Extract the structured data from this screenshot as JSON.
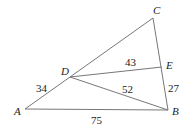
{
  "diagram": {
    "type": "geometry-triangle",
    "points": {
      "A": {
        "label": "A",
        "x": 25,
        "y": 109
      },
      "B": {
        "label": "B",
        "x": 168,
        "y": 110
      },
      "C": {
        "label": "C",
        "x": 153,
        "y": 18
      },
      "D": {
        "label": "D",
        "x": 70,
        "y": 77
      },
      "E": {
        "label": "E",
        "x": 162,
        "y": 67
      }
    },
    "segments": [
      {
        "from": "A",
        "to": "B",
        "length": "75"
      },
      {
        "from": "A",
        "to": "D",
        "length": "34"
      },
      {
        "from": "D",
        "to": "C",
        "length": ""
      },
      {
        "from": "C",
        "to": "B",
        "length": ""
      },
      {
        "from": "D",
        "to": "E",
        "length": "43"
      },
      {
        "from": "D",
        "to": "B",
        "length": "52"
      },
      {
        "from": "E",
        "to": "B",
        "length": "27"
      }
    ],
    "labels": {
      "AB": "75",
      "AD": "34",
      "DE": "43",
      "DB": "52",
      "EB": "27"
    },
    "colors": {
      "line": "#777777",
      "text": "#222222"
    }
  }
}
